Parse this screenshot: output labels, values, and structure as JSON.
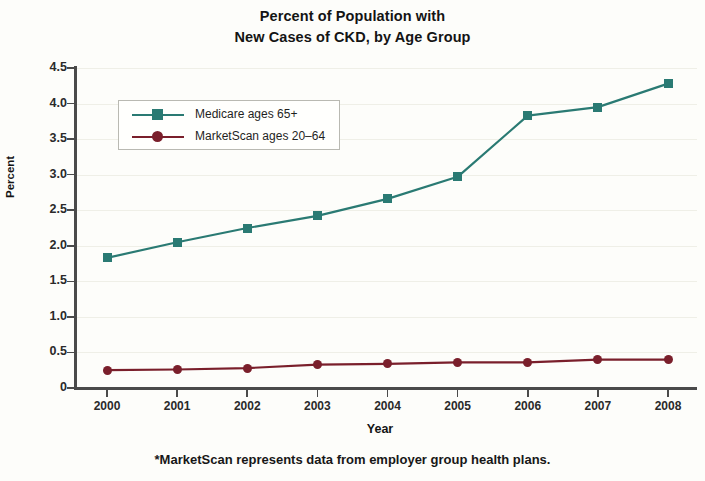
{
  "title": {
    "line1": "Percent of Population with",
    "line2": "New Cases of CKD, by Age Group"
  },
  "footnote": "*MarketScan represents data from employer group health plans.",
  "legend": {
    "items": [
      {
        "label": "Medicare ages 65+",
        "color": "#2a7a73",
        "marker": "square"
      },
      {
        "label": "MarketScan ages 20–64",
        "color": "#7a1f2b",
        "marker": "circle"
      }
    ]
  },
  "chart_data": {
    "type": "line",
    "title": "Percent of Population with New Cases of CKD, by Age Group",
    "xlabel": "Year",
    "ylabel": "Percent",
    "x": [
      2000,
      2001,
      2002,
      2003,
      2004,
      2005,
      2006,
      2007,
      2008
    ],
    "xtick_labels": [
      "2000",
      "2001",
      "2002",
      "2003",
      "2004",
      "2005",
      "2006",
      "2007",
      "2008"
    ],
    "ytick_labels": [
      "0",
      "0.5",
      "1.0",
      "1.5",
      "2.0",
      "2.5",
      "3.0",
      "3.5",
      "4.0",
      "4.5"
    ],
    "ytick_values": [
      0,
      0.5,
      1.0,
      1.5,
      2.0,
      2.5,
      3.0,
      3.5,
      4.0,
      4.5
    ],
    "ylim": [
      0,
      4.5
    ],
    "xlim": [
      2000,
      2008
    ],
    "grid": true,
    "legend_position": "upper left inside",
    "series": [
      {
        "name": "Medicare ages 65+",
        "color": "#2a7a73",
        "marker": "square",
        "values": [
          1.83,
          2.05,
          2.25,
          2.42,
          2.66,
          2.97,
          3.83,
          3.95,
          4.28
        ]
      },
      {
        "name": "MarketScan ages 20–64",
        "color": "#7a1f2b",
        "marker": "circle",
        "values": [
          0.25,
          0.26,
          0.28,
          0.33,
          0.34,
          0.36,
          0.36,
          0.4,
          0.4
        ]
      }
    ]
  }
}
